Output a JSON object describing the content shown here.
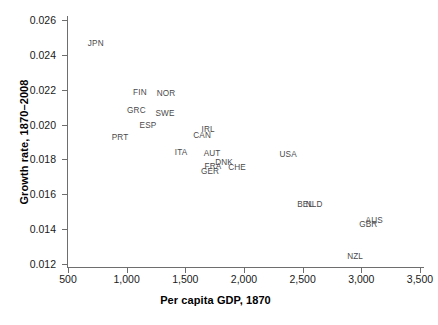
{
  "chart_data": {
    "type": "scatter",
    "title": "",
    "xlabel": "Per capita GDP, 1870",
    "ylabel": "Growth rate, 1870–2008",
    "xlim": [
      350,
      3600
    ],
    "ylim": [
      0.0115,
      0.0265
    ],
    "grid": false,
    "legend": null,
    "xticks": [
      500,
      1000,
      1500,
      2000,
      2500,
      3000,
      3500
    ],
    "xticklabels": [
      "500",
      "1,000",
      "1,500",
      "2,000",
      "2,500",
      "3,000",
      "3,500"
    ],
    "yticks": [
      0.012,
      0.014,
      0.016,
      0.018,
      0.02,
      0.022,
      0.024,
      0.026
    ],
    "yticklabels": [
      "0.012",
      "0.014",
      "0.016",
      "0.018",
      "0.020",
      "0.022",
      "0.024",
      "0.026"
    ],
    "marker_style": "text-label-only",
    "points": [
      {
        "label": "JPN",
        "x": 737,
        "y": 0.02468
      },
      {
        "label": "FIN",
        "x": 1113,
        "y": 0.02187
      },
      {
        "label": "NOR",
        "x": 1335,
        "y": 0.02181
      },
      {
        "label": "GRC",
        "x": 1083,
        "y": 0.02081
      },
      {
        "label": "SWE",
        "x": 1327,
        "y": 0.02069
      },
      {
        "label": "ESP",
        "x": 1182,
        "y": 0.02
      },
      {
        "label": "PRT",
        "x": 943,
        "y": 0.01931
      },
      {
        "label": "IRL",
        "x": 1694,
        "y": 0.01975
      },
      {
        "label": "CAN",
        "x": 1643,
        "y": 0.0194
      },
      {
        "label": "ITA",
        "x": 1464,
        "y": 0.01843
      },
      {
        "label": "AUT",
        "x": 1728,
        "y": 0.01837
      },
      {
        "label": "DNK",
        "x": 1830,
        "y": 0.01785
      },
      {
        "label": "FRA",
        "x": 1736,
        "y": 0.01762
      },
      {
        "label": "CHE",
        "x": 1941,
        "y": 0.01756
      },
      {
        "label": "GER",
        "x": 1711,
        "y": 0.01733
      },
      {
        "label": "USA",
        "x": 2376,
        "y": 0.01831
      },
      {
        "label": "BEL",
        "x": 2521,
        "y": 0.01544
      },
      {
        "label": "NLD",
        "x": 2598,
        "y": 0.01544
      },
      {
        "label": "AUS",
        "x": 3110,
        "y": 0.01452
      },
      {
        "label": "GBR",
        "x": 3059,
        "y": 0.01429
      },
      {
        "label": "NZL",
        "x": 2947,
        "y": 0.01245
      }
    ]
  },
  "axes": {
    "x_title": "Per capita GDP, 1870",
    "y_title": "Growth rate, 1870–2008"
  },
  "colors": {
    "axis": "#6e6e6e",
    "tick_text": "#1a1a1a",
    "label_text": "#4a4a4a",
    "background": "#ffffff"
  }
}
